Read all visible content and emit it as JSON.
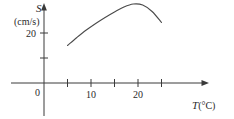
{
  "chart_data": {
    "type": "line",
    "title": "",
    "xlabel": "T (°C)",
    "ylabel": "S (cm/s)",
    "y_axis_symbol": "S",
    "y_axis_units": "(cm/s)",
    "x_axis_symbol": "T",
    "x_axis_units": "(°C)",
    "origin_label": "0",
    "grid": false,
    "legend": null,
    "xlim": [
      0,
      30
    ],
    "ylim": [
      0,
      40
    ],
    "x_ticks": [
      5,
      10,
      15,
      20,
      25
    ],
    "x_tick_labels": [
      "",
      "10",
      "",
      "20",
      ""
    ],
    "y_ticks": [
      10,
      20
    ],
    "y_tick_labels": [
      "",
      "20"
    ],
    "series": [
      {
        "name": "S vs T",
        "x": [
          5,
          7,
          9,
          11,
          13,
          15,
          17,
          19,
          21,
          23,
          25
        ],
        "y": [
          15.0,
          18.2,
          21.2,
          23.8,
          26.2,
          28.4,
          30.4,
          31.6,
          31.2,
          28.6,
          24.2
        ]
      }
    ],
    "annotations": []
  },
  "axes": {
    "y_symbol": "S",
    "y_units": "(cm/s)",
    "y_tick_20": "20",
    "origin": "0",
    "x_tick_10": "10",
    "x_tick_20": "20",
    "x_symbol": "T",
    "x_units": "(°C)"
  },
  "style": {
    "ink": "#3a3a3a",
    "curve": "#4a4a4a",
    "background": "#ffffff"
  }
}
